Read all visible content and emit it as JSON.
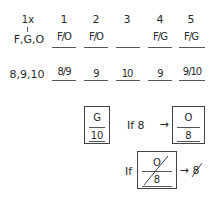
{
  "row_labels": {
    "multiplier": "1x",
    "letters": "F,G,O",
    "numbers": "8,9,10"
  },
  "columns": [
    {
      "header": "1",
      "letter_entry": "F/O",
      "number_entry": "8/9"
    },
    {
      "header": "2",
      "letter_entry": "F/O",
      "number_entry": "9"
    },
    {
      "header": "3",
      "letter_entry": "",
      "number_entry": "10"
    },
    {
      "header": "4",
      "letter_entry": "F/G",
      "number_entry": "9"
    },
    {
      "header": "5",
      "letter_entry": "F/G",
      "number_entry": "9/10"
    }
  ],
  "rules": {
    "box1": {
      "top": "G",
      "bottom": "10"
    },
    "rule1_prefix": "If 8",
    "arrow": "→",
    "box2": {
      "top": "O",
      "bottom": "8"
    },
    "rule2_prefix": "If",
    "box3": {
      "top": "O",
      "bottom": "8",
      "crossed_out": true
    },
    "rule2_result": "8",
    "rule2_result_crossed": true
  },
  "colors": {
    "ink": "#2a2a2a",
    "background": "#ffffff"
  }
}
